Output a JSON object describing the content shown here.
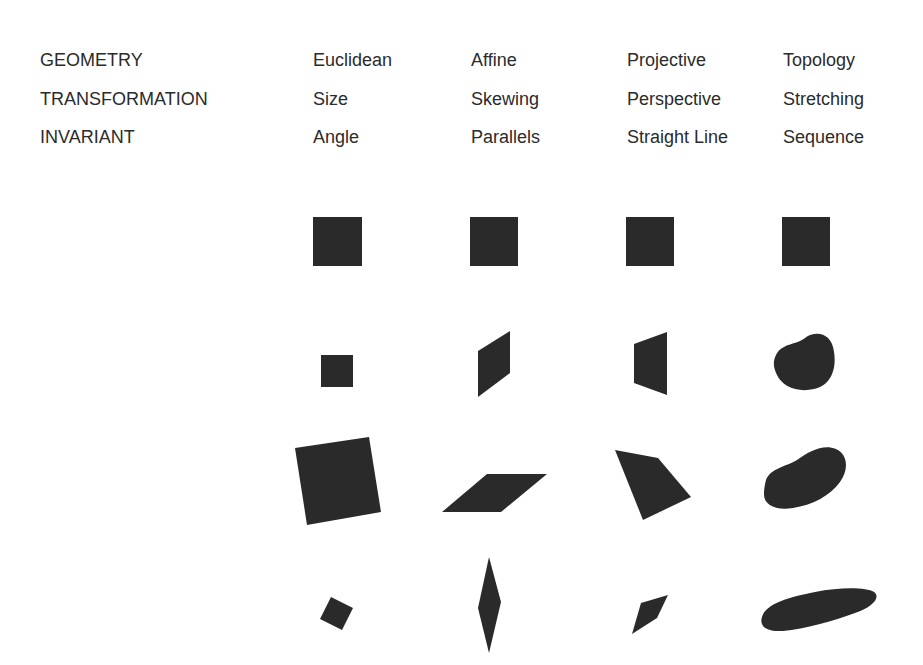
{
  "table": {
    "row_headers": [
      "GEOMETRY",
      "TRANSFORMATION",
      "INVARIANT"
    ],
    "columns": [
      {
        "geometry": "Euclidean",
        "transformation": "Size",
        "invariant": "Angle"
      },
      {
        "geometry": "Affine",
        "transformation": "Skewing",
        "invariant": "Parallels"
      },
      {
        "geometry": "Projective",
        "transformation": "Perspective",
        "invariant": "Straight Line"
      },
      {
        "geometry": "Topology",
        "transformation": "Stretching",
        "invariant": "Sequence"
      }
    ]
  },
  "figures": {
    "fill_color": "#2a2a2a",
    "background_color": "#ffffff",
    "rows": [
      {
        "description": "original square",
        "shapes": [
          "square",
          "square",
          "square",
          "square"
        ]
      },
      {
        "description": "first transformation",
        "shapes": [
          "small-square",
          "skewed-parallelogram",
          "perspective-trapezoid",
          "rounded-blob"
        ]
      },
      {
        "description": "second transformation",
        "shapes": [
          "rotated-large-square",
          "flat-parallelogram",
          "irregular-quadrilateral",
          "bean-blob"
        ]
      },
      {
        "description": "third transformation",
        "shapes": [
          "rotated-small-square",
          "thin-diamond",
          "small-quadrilateral",
          "elongated-ellipse"
        ]
      }
    ]
  }
}
